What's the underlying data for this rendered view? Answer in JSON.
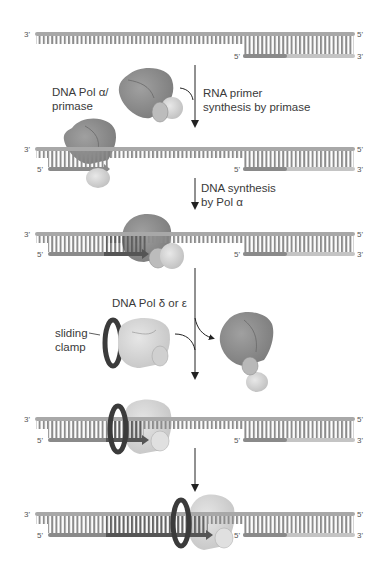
{
  "diagram": {
    "colors": {
      "strand_gray": "#a8a8a8",
      "base_pair": "#8c8c8c",
      "rna_primer": "#8a8a8a",
      "new_dna": "#555555",
      "pol_alpha": "#8e8e8e",
      "primase_small": "#cfcfcf",
      "pol_delta": "#d6d6d6",
      "sliding_clamp": "#3b3b3b",
      "arrow": "#222222",
      "text": "#3a3a3a"
    },
    "strand_ends": {
      "top_left": "3'",
      "top_right": "5'",
      "bottom_left": "5'",
      "bottom_right": "3'"
    },
    "labels": {
      "pol_alpha_line1": "DNA Pol α/",
      "pol_alpha_line2": "primase",
      "pol_delta": "DNA Pol δ or ε",
      "clamp_line1": "sliding",
      "clamp_line2": "clamp"
    },
    "steps": [
      {
        "line1": "RNA primer",
        "line2": "synthesis by primase"
      },
      {
        "line1": "DNA synthesis",
        "line2": "by Pol α"
      }
    ],
    "panels": [
      {
        "index": 1,
        "description": "Template with previous Okazaki fragment (RNA primer + DNA) on right"
      },
      {
        "index": 2,
        "description": "Pol α/primase bound, synthesizing RNA primer"
      },
      {
        "index": 3,
        "description": "Pol α extends primer with DNA"
      },
      {
        "index": 4,
        "description": "Sliding clamp and Pol δ/ε replace Pol α"
      },
      {
        "index": 5,
        "description": "Pol δ/ε extends fragment toward previous Okazaki fragment"
      }
    ]
  }
}
